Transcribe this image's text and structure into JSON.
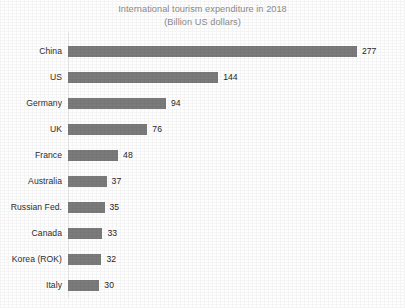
{
  "chart_data": {
    "type": "bar",
    "orientation": "horizontal",
    "title": "International tourism expenditure in 2018",
    "subtitle": "(Billion US dollars)",
    "xlabel": "",
    "ylabel": "",
    "grid": false,
    "legend": null,
    "xlim": [
      0,
      277
    ],
    "bar_color": "#7b7b7b",
    "title_color": "#8c8c8c",
    "label_color": "#2e2e2e",
    "value_label_color": "#1f1f1f",
    "categories": [
      "China",
      "US",
      "Germany",
      "UK",
      "France",
      "Australia",
      "Russian Fed.",
      "Canada",
      "Korea (ROK)",
      "Italy"
    ],
    "values": [
      277,
      144,
      94,
      76,
      48,
      37,
      35,
      33,
      32,
      30
    ],
    "value_labels": [
      "277",
      "144",
      "94",
      "76",
      "48",
      "37",
      "35",
      "33",
      "32",
      "30"
    ],
    "units": "Billion US dollars",
    "max_value": 277,
    "px_per_unit": 1.043
  }
}
